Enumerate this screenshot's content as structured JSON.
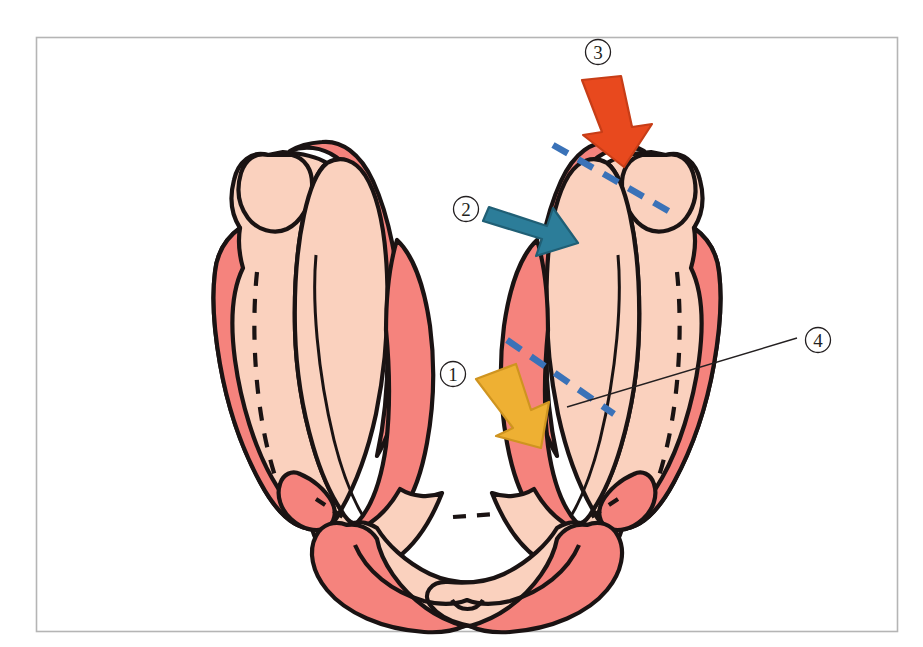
{
  "figure": {
    "type": "anatomical-illustration",
    "frame": {
      "border_color": "#b5b5b5",
      "background_color": "#ffffff",
      "x": 36,
      "y": 37,
      "width": 862,
      "height": 595
    },
    "palette": {
      "light_tissue": "#fad1be",
      "dark_tissue": "#f5837d",
      "outline": "#1a1313",
      "arrow_red": "#e8491e",
      "arrow_teal": "#2c7d99",
      "arrow_yellow": "#eeb033",
      "dashed_blue": "#3a72b8",
      "leader_line": "#231f20",
      "label_text": "#231f20"
    },
    "markers": [
      {
        "id": "marker-1",
        "label": "①",
        "number": 1,
        "x": 453,
        "y": 374,
        "arrow": "yellow",
        "arrow_direction": "down-right"
      },
      {
        "id": "marker-2",
        "label": "②",
        "number": 2,
        "x": 466,
        "y": 209,
        "arrow": "teal",
        "arrow_direction": "right-down"
      },
      {
        "id": "marker-3",
        "label": "③",
        "number": 3,
        "x": 598,
        "y": 52,
        "arrow": "red",
        "arrow_direction": "down"
      },
      {
        "id": "marker-4",
        "label": "④",
        "number": 4,
        "x": 818,
        "y": 340,
        "arrow": "none",
        "arrow_direction": "leader-line-to-left"
      }
    ],
    "dashed_guides": [
      {
        "id": "guide-upper",
        "x1": 553,
        "y1": 145,
        "x2": 672,
        "y2": 213
      },
      {
        "id": "guide-lower",
        "x1": 507,
        "y1": 340,
        "x2": 614,
        "y2": 414
      }
    ],
    "leader_lines": [
      {
        "id": "leader-4",
        "x1": 797,
        "y1": 338,
        "x2": 567,
        "y2": 407
      }
    ]
  }
}
